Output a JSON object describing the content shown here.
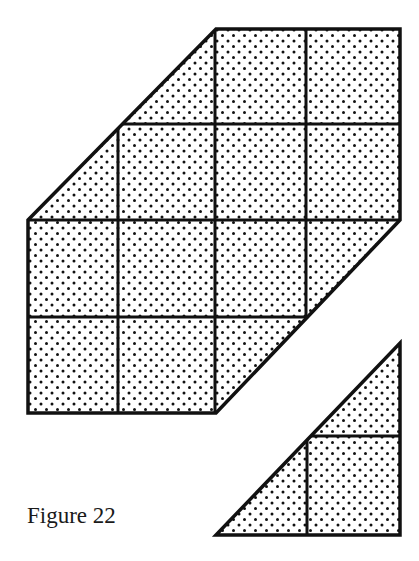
{
  "caption": "Figure 22",
  "colors": {
    "stroke": "#111111",
    "dot": "#111111",
    "background": "#ffffff"
  },
  "main_shape": {
    "description": "Hexagonal shape made of a 4x4 unit grid with two opposite corner triangles cut along diagonals",
    "outline": [
      [
        216,
        29
      ],
      [
        400,
        29
      ],
      [
        400,
        220
      ],
      [
        216,
        413
      ],
      [
        28,
        413
      ],
      [
        28,
        220
      ]
    ],
    "grid_x": [
      28,
      118,
      215,
      306,
      400
    ],
    "grid_y": [
      29,
      124,
      220,
      317,
      413
    ]
  },
  "small_triangle": {
    "outline": [
      [
        400,
        343
      ],
      [
        400,
        535
      ],
      [
        216,
        535
      ]
    ],
    "inner_vertical_x": 307,
    "inner_horizontal_y": 436
  }
}
